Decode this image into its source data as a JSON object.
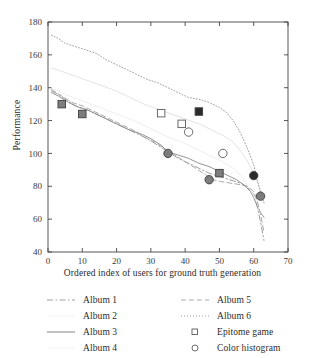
{
  "chart_data": {
    "type": "line",
    "title": "",
    "xlabel": "Ordered index of users for ground truth generation",
    "ylabel": "Performance",
    "xlim": [
      0,
      70
    ],
    "ylim": [
      40,
      180
    ],
    "xticks": [
      0,
      10,
      20,
      30,
      40,
      50,
      60,
      70
    ],
    "yticks": [
      40,
      60,
      80,
      100,
      120,
      140,
      160,
      180
    ],
    "grid": false,
    "legend_position": "below-plot",
    "series": [
      {
        "name": "Album 1",
        "style": "dash-dot",
        "color": "#9a9a9a",
        "points": [
          [
            1,
            138
          ],
          [
            3,
            136
          ],
          [
            5,
            133
          ],
          [
            8,
            129
          ],
          [
            11,
            127
          ],
          [
            14,
            124
          ],
          [
            17,
            121
          ],
          [
            20,
            118
          ],
          [
            23,
            115
          ],
          [
            26,
            112
          ],
          [
            29,
            109
          ],
          [
            32,
            105
          ],
          [
            35,
            101
          ],
          [
            38,
            97
          ],
          [
            41,
            94
          ],
          [
            44,
            91
          ],
          [
            47,
            88
          ],
          [
            50,
            86
          ],
          [
            53,
            84
          ],
          [
            56,
            82
          ],
          [
            58,
            80
          ],
          [
            60,
            75
          ],
          [
            61,
            68
          ],
          [
            62,
            58
          ],
          [
            63,
            47
          ]
        ]
      },
      {
        "name": "Album 2",
        "style": "solid-light",
        "color": "#e2e2e2",
        "points": [
          [
            1,
            152
          ],
          [
            4,
            150
          ],
          [
            8,
            147
          ],
          [
            12,
            144
          ],
          [
            16,
            141
          ],
          [
            20,
            138
          ],
          [
            24,
            134
          ],
          [
            28,
            130
          ],
          [
            32,
            127
          ],
          [
            36,
            124
          ],
          [
            40,
            121
          ],
          [
            44,
            118
          ],
          [
            48,
            114
          ],
          [
            51,
            111
          ],
          [
            54,
            107
          ],
          [
            56,
            102
          ],
          [
            58,
            96
          ],
          [
            60,
            88
          ],
          [
            62,
            78
          ],
          [
            63,
            70
          ]
        ]
      },
      {
        "name": "Album 3",
        "style": "solid",
        "color": "#8e8e8e",
        "points": [
          [
            1,
            137
          ],
          [
            3,
            135
          ],
          [
            6,
            131
          ],
          [
            9,
            128
          ],
          [
            12,
            126
          ],
          [
            15,
            123
          ],
          [
            18,
            120
          ],
          [
            21,
            117
          ],
          [
            24,
            114
          ],
          [
            27,
            112
          ],
          [
            30,
            109
          ],
          [
            33,
            105
          ],
          [
            35,
            101
          ],
          [
            38,
            99
          ],
          [
            41,
            97
          ],
          [
            44,
            94
          ],
          [
            47,
            92
          ],
          [
            50,
            89
          ],
          [
            53,
            86
          ],
          [
            55,
            84
          ],
          [
            57,
            81
          ],
          [
            59,
            77
          ],
          [
            60,
            73
          ],
          [
            61,
            68
          ],
          [
            62,
            64
          ],
          [
            63,
            61
          ]
        ]
      },
      {
        "name": "Album 4",
        "style": "solid-light",
        "color": "#ededed",
        "points": [
          [
            1,
            140
          ],
          [
            5,
            136
          ],
          [
            10,
            132
          ],
          [
            15,
            128
          ],
          [
            20,
            124
          ],
          [
            25,
            120
          ],
          [
            30,
            115
          ],
          [
            35,
            110
          ],
          [
            40,
            106
          ],
          [
            45,
            101
          ],
          [
            50,
            96
          ],
          [
            54,
            91
          ],
          [
            57,
            85
          ],
          [
            59,
            78
          ],
          [
            61,
            70
          ],
          [
            62,
            63
          ]
        ]
      },
      {
        "name": "Album 5",
        "style": "dashed",
        "color": "#a5a5a5",
        "points": [
          [
            1,
            139
          ],
          [
            4,
            135
          ],
          [
            7,
            131
          ],
          [
            10,
            129
          ],
          [
            13,
            126
          ],
          [
            16,
            123
          ],
          [
            19,
            120
          ],
          [
            22,
            117
          ],
          [
            25,
            114
          ],
          [
            28,
            110
          ],
          [
            31,
            107
          ],
          [
            34,
            103
          ],
          [
            37,
            99
          ],
          [
            40,
            95
          ],
          [
            43,
            91
          ],
          [
            46,
            87
          ],
          [
            48,
            84
          ],
          [
            50,
            83
          ],
          [
            53,
            82
          ],
          [
            56,
            81
          ],
          [
            58,
            80
          ],
          [
            60,
            77
          ],
          [
            61,
            71
          ],
          [
            62,
            63
          ],
          [
            63,
            52
          ]
        ]
      },
      {
        "name": "Album 6",
        "style": "dotted",
        "color": "#9c9c9c",
        "points": [
          [
            1,
            172
          ],
          [
            3,
            170
          ],
          [
            5,
            167
          ],
          [
            8,
            165
          ],
          [
            11,
            163
          ],
          [
            14,
            161
          ],
          [
            17,
            157
          ],
          [
            20,
            154
          ],
          [
            23,
            151
          ],
          [
            26,
            148
          ],
          [
            29,
            145
          ],
          [
            32,
            143
          ],
          [
            35,
            140
          ],
          [
            38,
            137
          ],
          [
            41,
            134
          ],
          [
            44,
            133
          ],
          [
            47,
            131
          ],
          [
            50,
            128
          ],
          [
            52,
            125
          ],
          [
            54,
            120
          ],
          [
            56,
            113
          ],
          [
            58,
            104
          ],
          [
            60,
            93
          ],
          [
            61,
            84
          ],
          [
            62,
            76
          ],
          [
            63,
            70
          ]
        ]
      }
    ],
    "markers": [
      {
        "name": "Epitome game",
        "shape": "square",
        "fill": "open",
        "x": 33,
        "y": 124.5
      },
      {
        "name": "Epitome game",
        "shape": "square",
        "fill": "open",
        "x": 39,
        "y": 118
      },
      {
        "name": "Epitome game",
        "shape": "square",
        "fill": "dark",
        "x": 44,
        "y": 125.5
      },
      {
        "name": "Epitome game",
        "shape": "square",
        "fill": "gray",
        "x": 4,
        "y": 130
      },
      {
        "name": "Epitome game",
        "shape": "square",
        "fill": "gray",
        "x": 10,
        "y": 124
      },
      {
        "name": "Epitome game",
        "shape": "square",
        "fill": "gray",
        "x": 50,
        "y": 88
      },
      {
        "name": "Color histogram",
        "shape": "circle",
        "fill": "open",
        "x": 41,
        "y": 113
      },
      {
        "name": "Color histogram",
        "shape": "circle",
        "fill": "open",
        "x": 51,
        "y": 100
      },
      {
        "name": "Color histogram",
        "shape": "circle",
        "fill": "gray",
        "x": 35,
        "y": 100
      },
      {
        "name": "Color histogram",
        "shape": "circle",
        "fill": "gray",
        "x": 47,
        "y": 84
      },
      {
        "name": "Color histogram",
        "shape": "circle",
        "fill": "dark",
        "x": 60,
        "y": 86.5
      },
      {
        "name": "Color histogram",
        "shape": "circle",
        "fill": "gray",
        "x": 62,
        "y": 74
      }
    ]
  },
  "legend": {
    "left": [
      {
        "label": "Album 1",
        "sample": "dash-dot-line"
      },
      {
        "label": "Album 2",
        "sample": "light-line"
      },
      {
        "label": "Album 3",
        "sample": "solid-line"
      },
      {
        "label": "Album 4",
        "sample": "light-line"
      }
    ],
    "right": [
      {
        "label": "Album 5",
        "sample": "dashed-line"
      },
      {
        "label": "Album 6",
        "sample": "dotted-line"
      },
      {
        "label": "Epitome game",
        "sample": "open-square-marker"
      },
      {
        "label": "Color histogram",
        "sample": "open-circle-marker"
      }
    ]
  },
  "colors": {
    "axis": "#444444",
    "marker_gray": "#7d7d7d",
    "marker_dark": "#2b2b2b",
    "marker_open_stroke": "#5a5a5a"
  }
}
